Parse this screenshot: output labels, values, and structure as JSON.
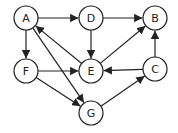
{
  "diagram": {
    "type": "directed-graph",
    "node_radius": 12,
    "colors": {
      "stroke": "#222222",
      "fill": "#ffffff"
    },
    "nodes": [
      {
        "id": "A",
        "label": "A",
        "x": 26,
        "y": 18
      },
      {
        "id": "D",
        "label": "D",
        "x": 91,
        "y": 18
      },
      {
        "id": "B",
        "label": "B",
        "x": 155,
        "y": 18
      },
      {
        "id": "F",
        "label": "F",
        "x": 26,
        "y": 71
      },
      {
        "id": "E",
        "label": "E",
        "x": 91,
        "y": 71
      },
      {
        "id": "C",
        "label": "C",
        "x": 155,
        "y": 69
      },
      {
        "id": "G",
        "label": "G",
        "x": 91,
        "y": 113
      }
    ],
    "edges": [
      {
        "from": "A",
        "to": "D"
      },
      {
        "from": "D",
        "to": "B"
      },
      {
        "from": "A",
        "to": "F"
      },
      {
        "from": "D",
        "to": "E"
      },
      {
        "from": "E",
        "to": "A"
      },
      {
        "from": "E",
        "to": "B"
      },
      {
        "from": "C",
        "to": "B"
      },
      {
        "from": "F",
        "to": "E"
      },
      {
        "from": "C",
        "to": "E"
      },
      {
        "from": "F",
        "to": "G"
      },
      {
        "from": "A",
        "to": "G"
      },
      {
        "from": "G",
        "to": "C"
      }
    ]
  }
}
